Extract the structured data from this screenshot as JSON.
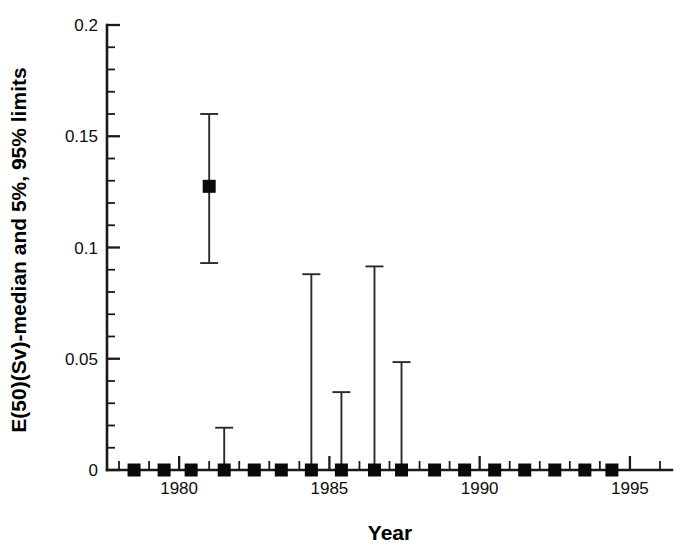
{
  "chart_data": {
    "type": "scatter",
    "title": "",
    "xlabel": "Year",
    "ylabel": "E(50)(Sv)-median and 5%, 95% limits",
    "xlim": [
      1977.6,
      1996.4
    ],
    "ylim": [
      0,
      0.2
    ],
    "grid": false,
    "legend": null,
    "x_ticks_major": [
      1980,
      1985,
      1990,
      1995
    ],
    "x_ticklabels": [
      "1980",
      "1985",
      "1990",
      "1995"
    ],
    "x_minor_tick_step": 1,
    "y_ticks_major": [
      0,
      0.05,
      0.1,
      0.15,
      0.2
    ],
    "y_ticklabels": [
      "0",
      "0.05",
      "0.1",
      "0.15",
      "0.2"
    ],
    "y_minor_tick_step": 0.01,
    "marker_style": "filled-square",
    "error_bar_style": "capped-vertical",
    "x": [
      1978.5,
      1979.5,
      1980.4,
      1981.0,
      1981.5,
      1982.5,
      1983.4,
      1984.4,
      1985.4,
      1986.5,
      1987.4,
      1988.5,
      1989.5,
      1990.5,
      1991.5,
      1992.5,
      1993.5,
      1994.4
    ],
    "median": [
      0.0,
      0.0,
      0.0,
      0.1275,
      0.0,
      0.0,
      0.0,
      0.0,
      0.0,
      0.0,
      0.0,
      0.0,
      0.0,
      0.0,
      0.0,
      0.0,
      0.0,
      0.0
    ],
    "upper_95": [
      0.0,
      0.0,
      0.0,
      0.16,
      0.019,
      0.0,
      0.0,
      0.088,
      0.035,
      0.0915,
      0.0485,
      0.0,
      0.0,
      0.0,
      0.0,
      0.0,
      0.0,
      0.0
    ],
    "lower_5": [
      0.0,
      0.0,
      0.0,
      0.093,
      0.0,
      0.0,
      0.0,
      0.0,
      0.0,
      0.0,
      0.0,
      0.0,
      0.0,
      0.0,
      0.0,
      0.0,
      0.0,
      0.0
    ],
    "points": [
      {
        "year": 1978.5,
        "median": 0.0,
        "lower_5": 0.0,
        "upper_95": 0.0
      },
      {
        "year": 1979.5,
        "median": 0.0,
        "lower_5": 0.0,
        "upper_95": 0.0
      },
      {
        "year": 1980.4,
        "median": 0.0,
        "lower_5": 0.0,
        "upper_95": 0.0
      },
      {
        "year": 1981.0,
        "median": 0.1275,
        "lower_5": 0.093,
        "upper_95": 0.16
      },
      {
        "year": 1981.5,
        "median": 0.0,
        "lower_5": 0.0,
        "upper_95": 0.019
      },
      {
        "year": 1982.5,
        "median": 0.0,
        "lower_5": 0.0,
        "upper_95": 0.0
      },
      {
        "year": 1983.4,
        "median": 0.0,
        "lower_5": 0.0,
        "upper_95": 0.0
      },
      {
        "year": 1984.4,
        "median": 0.0,
        "lower_5": 0.0,
        "upper_95": 0.088
      },
      {
        "year": 1985.4,
        "median": 0.0,
        "lower_5": 0.0,
        "upper_95": 0.035
      },
      {
        "year": 1986.5,
        "median": 0.0,
        "lower_5": 0.0,
        "upper_95": 0.0915
      },
      {
        "year": 1987.4,
        "median": 0.0,
        "lower_5": 0.0,
        "upper_95": 0.0485
      },
      {
        "year": 1988.5,
        "median": 0.0,
        "lower_5": 0.0,
        "upper_95": 0.0
      },
      {
        "year": 1989.5,
        "median": 0.0,
        "lower_5": 0.0,
        "upper_95": 0.0
      },
      {
        "year": 1990.5,
        "median": 0.0,
        "lower_5": 0.0,
        "upper_95": 0.0
      },
      {
        "year": 1991.5,
        "median": 0.0,
        "lower_5": 0.0,
        "upper_95": 0.0
      },
      {
        "year": 1992.5,
        "median": 0.0,
        "lower_5": 0.0,
        "upper_95": 0.0
      },
      {
        "year": 1993.5,
        "median": 0.0,
        "lower_5": 0.0,
        "upper_95": 0.0
      },
      {
        "year": 1994.4,
        "median": 0.0,
        "lower_5": 0.0,
        "upper_95": 0.0
      }
    ],
    "colors": {
      "marker": "#0a0a0a",
      "error_bar": "#2b2b2b",
      "axis": "#1a1a1a",
      "background": "#ffffff"
    }
  }
}
